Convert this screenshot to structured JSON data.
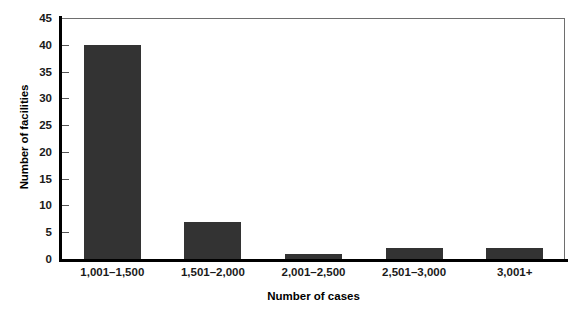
{
  "chart_data": {
    "type": "bar",
    "title": "",
    "subtitle": "",
    "xlabel": "Number of cases",
    "ylabel": "Number of facilities",
    "categories": [
      "1,001–1,500",
      "1,501–2,000",
      "2,001–2,500",
      "2,501–3,000",
      "3,001+"
    ],
    "values": [
      40,
      7,
      1,
      2,
      2
    ],
    "ylim": [
      0,
      45
    ],
    "ytick_values": [
      0,
      5,
      10,
      15,
      20,
      25,
      30,
      35,
      40,
      45
    ],
    "ytick_labels": [
      "0",
      "5",
      "10",
      "15",
      "20",
      "25",
      "30",
      "35",
      "40",
      "45"
    ],
    "grid": false,
    "legend": false,
    "legend_position": "none",
    "bar_color": "#333333",
    "axis_color": "#000000",
    "frame_color": "#6e6e6e",
    "background_color": "#ffffff",
    "annotations": []
  }
}
